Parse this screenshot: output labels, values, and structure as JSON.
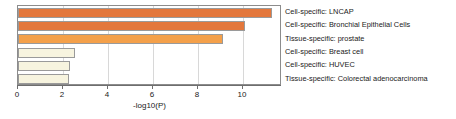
{
  "chart_data": {
    "type": "bar",
    "orientation": "horizontal",
    "title": "",
    "xlabel": "-log10(P)",
    "ylabel": "",
    "xlim": [
      0,
      11.73
    ],
    "xticks": [
      0,
      2,
      4,
      6,
      8,
      10
    ],
    "xtick_labels": [
      "0",
      "2",
      "4",
      "6",
      "8",
      "10"
    ],
    "grid": "vertical-at-xticks",
    "legend": "none",
    "categories": [
      "Cell-specific: LNCAP",
      "Cell-specific: Bronchial Epithelial Cells",
      "Tissue-specific: prostate",
      "Cell-specific: Breast cell",
      "Cell-specific: HUVEC",
      "Tissue-specific: Colorectal adenocarcinoma"
    ],
    "values": [
      11.3,
      10.1,
      9.1,
      2.55,
      2.3,
      2.25
    ],
    "bar_colors": [
      "#E3773C",
      "#E3773C",
      "#F4A04A",
      "#F7F4DF",
      "#F7F4DF",
      "#F7F4DF"
    ],
    "bar_edge_color": "#9A9A9A",
    "axis_color": "#6E6E6E",
    "frame_color": "#8C8C8C",
    "grid_color": "#D8D8D8",
    "background": "#FFFFFF",
    "text_color": "#1A1A1A"
  }
}
